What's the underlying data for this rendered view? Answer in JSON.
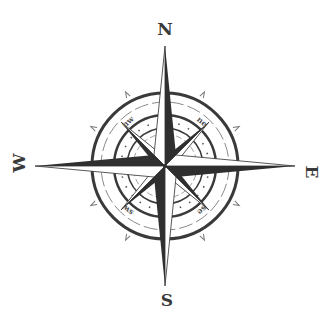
{
  "diagram": {
    "type": "compass-rose",
    "center": [
      165,
      166
    ],
    "cardinals": {
      "north": "N",
      "south": "S",
      "east": "E",
      "west": "W"
    },
    "intercardinals": {
      "northeast": "ne",
      "northwest": "nw",
      "southeast": "se",
      "southwest": "sw"
    },
    "colors": {
      "dark": "#2f2f2f",
      "light": "#ffffff",
      "ring": "#3a3a3a",
      "tick": "#8a8a8a",
      "background": "#ffffff"
    }
  }
}
